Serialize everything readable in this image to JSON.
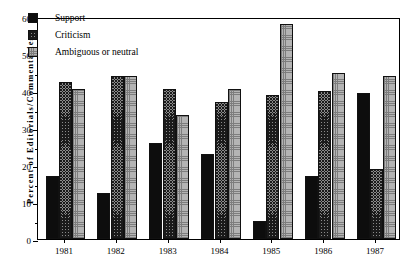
{
  "chart_data": {
    "type": "bar",
    "title": "",
    "xlabel": "",
    "ylabel": "Percent  of  Editorials/Commentaries",
    "categories": [
      "1981",
      "1982",
      "1983",
      "1984",
      "1985",
      "1986",
      "1987"
    ],
    "series": [
      {
        "name": "Support",
        "values": [
          17.0,
          12.5,
          26.0,
          23.0,
          5.0,
          17.0,
          39.5
        ]
      },
      {
        "name": "Criticism",
        "values": [
          42.5,
          44.0,
          40.5,
          37.0,
          39.0,
          40.0,
          19.0
        ]
      },
      {
        "name": "Ambiguous or neutral",
        "values": [
          40.5,
          44.0,
          33.5,
          40.5,
          58.0,
          45.0,
          44.0
        ]
      }
    ],
    "ylim": [
      0,
      60
    ],
    "yticks": [
      0,
      10,
      20,
      30,
      40,
      50,
      60
    ],
    "ytick_labels": [
      "0",
      "10",
      "20",
      "30",
      "40",
      "50",
      "60"
    ],
    "yminor_step": 5,
    "grid": false,
    "legend_position": "upper-left",
    "colors": {
      "support": "#0d0d0d",
      "criticism": "#8a8a8a",
      "ambiguous": "#b4b4b4",
      "axis": "#000000"
    }
  },
  "legend": {
    "entries": [
      {
        "label": "Support",
        "key": "support-swatch"
      },
      {
        "label": "Criticism",
        "key": "criticism-swatch"
      },
      {
        "label": "Ambiguous or neutral",
        "key": "ambiguous-swatch"
      }
    ]
  }
}
